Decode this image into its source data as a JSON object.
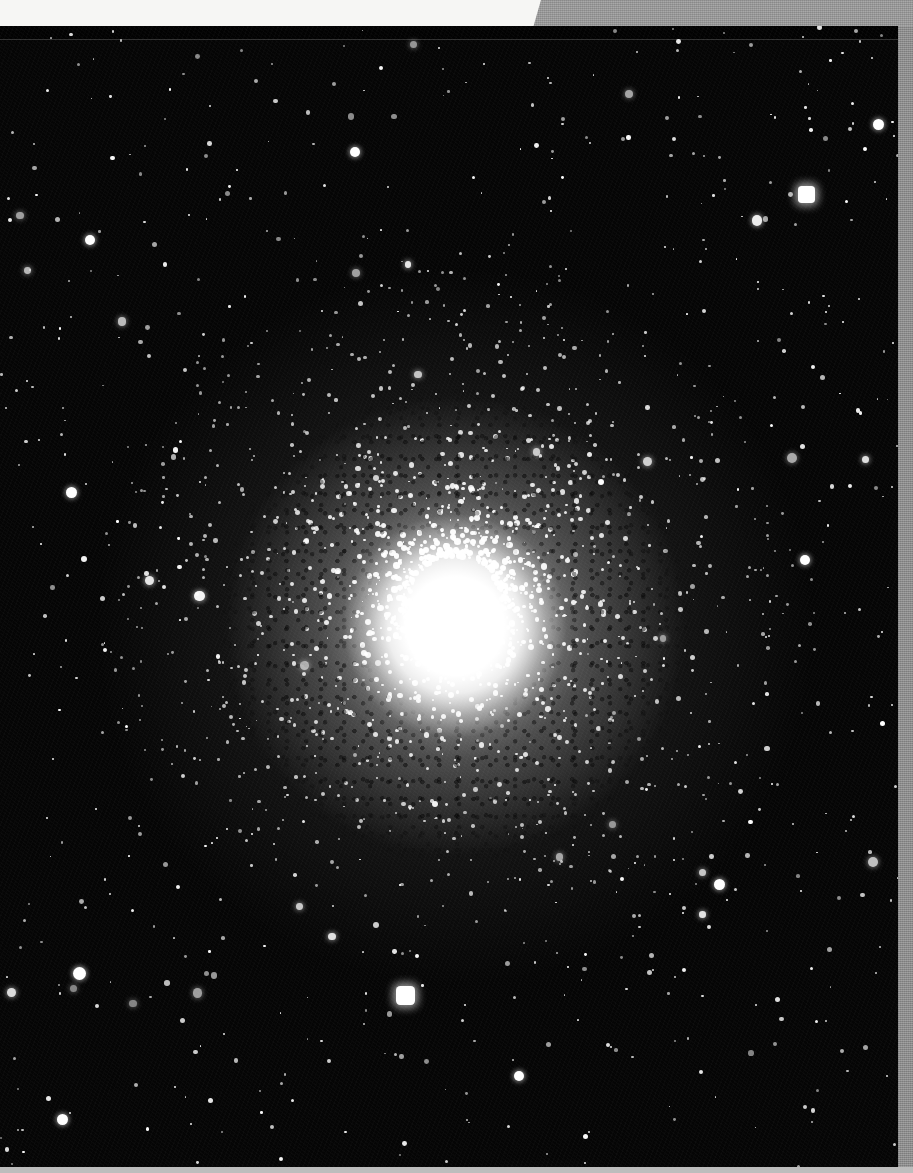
{
  "page": {
    "width": 913,
    "height": 1173,
    "background_color": "#f6f6f4",
    "margin_gray_color": "#9b9b9b",
    "margin_gray_right_color": "#919191",
    "margin_bottom_color": "#bdbdbd"
  },
  "plate": {
    "name": "globular-cluster-photographic-plate",
    "x": 0,
    "y": 26,
    "width": 898,
    "height": 1141,
    "background_color": "#050505",
    "star_color": "#ffffff",
    "description": "Black-and-white photographic plate of a globular star cluster: saturated white core surrounded by a dense resolved halo of stars fading into a sparse field of foreground stars."
  },
  "cluster": {
    "center_x": 455,
    "center_y": 600,
    "core_radius": 86,
    "dense_halo_radius": 225,
    "outer_halo_radius": 350,
    "core_color": "#ffffff"
  },
  "bright_field_stars": [
    {
      "label": "bright-star-bottom-center",
      "x": 405,
      "y": 995,
      "size": 19
    },
    {
      "label": "bright-star-top-right",
      "x": 806,
      "y": 194,
      "size": 17
    },
    {
      "label": "bright-star-left-lower",
      "x": 79,
      "y": 973,
      "size": 13
    },
    {
      "label": "bright-star-right-upper",
      "x": 878,
      "y": 124,
      "size": 11
    },
    {
      "label": "bright-star-left-mid",
      "x": 71,
      "y": 492,
      "size": 11
    },
    {
      "label": "bright-star-left-upper",
      "x": 90,
      "y": 240,
      "size": 10
    },
    {
      "label": "bright-star-lower-right",
      "x": 719,
      "y": 884,
      "size": 11
    },
    {
      "label": "bright-star-bottom-left",
      "x": 62,
      "y": 1119,
      "size": 11
    },
    {
      "label": "bright-star-mid-right",
      "x": 805,
      "y": 560,
      "size": 10
    },
    {
      "label": "bright-star-upper-mid",
      "x": 355,
      "y": 152,
      "size": 10
    },
    {
      "label": "bright-star-lower-mid",
      "x": 519,
      "y": 1076,
      "size": 10
    }
  ],
  "field": {
    "star_count_rendered": 760,
    "cluster_member_count_rendered": 1500,
    "note": "Halftone print; background is near-black with fine emulsion grain."
  }
}
